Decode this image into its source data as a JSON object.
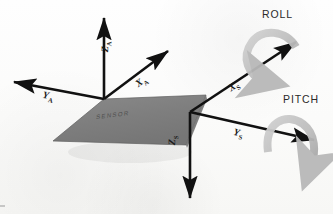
{
  "figure": {
    "background_color": "#fdfdfc",
    "plate": {
      "label": "SENSOR",
      "fill_color": "#808080",
      "edge_color": "#5a5a5a"
    },
    "axes": {
      "aircraft": [
        {
          "name": "Z_A",
          "letter": "Z",
          "subscript": "A",
          "direction": "up",
          "color": "#111111"
        },
        {
          "name": "X_A",
          "letter": "X",
          "subscript": "A",
          "direction": "up-right",
          "color": "#111111"
        },
        {
          "name": "Y_A",
          "letter": "Y",
          "subscript": "A",
          "direction": "left",
          "color": "#111111"
        }
      ],
      "sensor": [
        {
          "name": "X_S",
          "letter": "X",
          "subscript": "S",
          "direction": "up-right",
          "color": "#111111"
        },
        {
          "name": "Y_S",
          "letter": "Y",
          "subscript": "S",
          "direction": "right-down",
          "color": "#111111"
        },
        {
          "name": "Z_S",
          "letter": "Z",
          "subscript": "S",
          "direction": "down",
          "color": "#111111"
        }
      ]
    },
    "rotations": [
      {
        "name": "roll",
        "label": "ROLL",
        "about_axis": "X_S",
        "arrow_color": "#b4b4b4"
      },
      {
        "name": "pitch",
        "label": "PITCH",
        "about_axis": "Y_S",
        "arrow_color": "#b4b4b4"
      }
    ]
  }
}
